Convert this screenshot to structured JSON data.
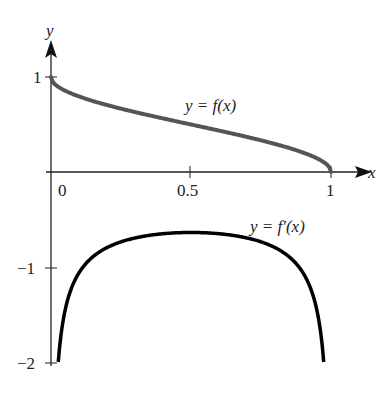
{
  "chart_data": {
    "type": "line",
    "title": "",
    "xlabel": "x",
    "ylabel": "y",
    "xlim": [
      0,
      1
    ],
    "ylim": [
      -2,
      1
    ],
    "x_ticks": [
      "0",
      "0.5",
      "1"
    ],
    "y_ticks": [
      "1",
      "-1",
      "-2"
    ],
    "grid": false,
    "series": [
      {
        "name": "y = f(x)",
        "color": "#555555",
        "x": [
          0,
          0.1,
          0.2,
          0.3,
          0.4,
          0.5,
          0.6,
          0.7,
          0.8,
          0.9,
          1.0
        ],
        "values": [
          1.0,
          0.795,
          0.705,
          0.631,
          0.564,
          0.5,
          0.436,
          0.369,
          0.295,
          0.205,
          0.0
        ]
      },
      {
        "name": "y = f'(x)",
        "color": "#000000",
        "x": [
          0.01,
          0.05,
          0.1,
          0.2,
          0.3,
          0.4,
          0.5,
          0.6,
          0.7,
          0.8,
          0.9,
          0.95,
          0.99
        ],
        "values": [
          -2.0,
          -1.46,
          -1.06,
          -0.8,
          -0.69,
          -0.65,
          -0.64,
          -0.65,
          -0.69,
          -0.8,
          -1.06,
          -1.46,
          -2.0
        ]
      }
    ],
    "annotations": [
      "y = f(x)",
      "y = f′(x)"
    ]
  },
  "labels": {
    "x_axis": "x",
    "y_axis": "y",
    "tick_x0": "0",
    "tick_x05": "0.5",
    "tick_x1": "1",
    "tick_y1": "1",
    "tick_ym1": "−1",
    "tick_ym2": "−2",
    "f_label": "y = f(x)",
    "fp_label": "y = f′(x)"
  }
}
